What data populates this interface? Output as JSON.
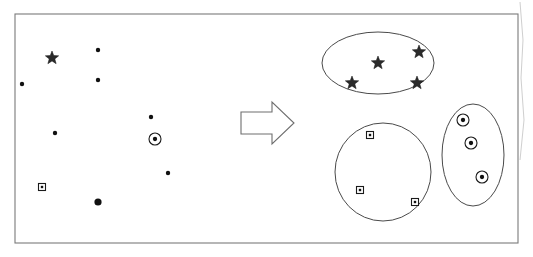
{
  "figure": {
    "background_color": "#ffffff",
    "frame_color": "#7a7a7a",
    "ink_color": "#1a1a1a"
  },
  "frame": {
    "x": 15,
    "y": 14,
    "width": 503,
    "height": 229
  },
  "arrow": {
    "name": "right-arrow",
    "points": "241,112 272,112 272,102 294,123 272,144 272,134 241,134",
    "fill": "#ffffff",
    "stroke": "#6e6e6e"
  },
  "left_panel": {
    "label": "unclustered-points",
    "points": [
      {
        "shape": "star",
        "x": 52,
        "y": 58,
        "size": 7
      },
      {
        "shape": "dot",
        "x": 98,
        "y": 50,
        "size": 2.2
      },
      {
        "shape": "dot",
        "x": 22,
        "y": 84,
        "size": 2.2
      },
      {
        "shape": "dot",
        "x": 98,
        "y": 80,
        "size": 2.2
      },
      {
        "shape": "dot",
        "x": 151,
        "y": 117,
        "size": 2.2
      },
      {
        "shape": "dot",
        "x": 55,
        "y": 133,
        "size": 2.2
      },
      {
        "shape": "circled-dot",
        "x": 155,
        "y": 139,
        "size": 6
      },
      {
        "shape": "dot",
        "x": 168,
        "y": 173,
        "size": 2.2
      },
      {
        "shape": "squared-dot",
        "x": 42,
        "y": 187,
        "size": 7
      },
      {
        "shape": "dot",
        "x": 98,
        "y": 202,
        "size": 3.6
      }
    ]
  },
  "right_panel": {
    "label": "clustered-groups",
    "clusters": [
      {
        "name": "star-cluster",
        "boundary": {
          "type": "ellipse",
          "cx": 378,
          "cy": 63,
          "rx": 56,
          "ry": 31
        },
        "members": [
          {
            "shape": "star",
            "x": 378,
            "y": 63,
            "size": 7
          },
          {
            "shape": "star",
            "x": 419,
            "y": 52,
            "size": 7
          },
          {
            "shape": "star",
            "x": 352,
            "y": 83,
            "size": 7
          },
          {
            "shape": "star",
            "x": 417,
            "y": 83,
            "size": 7
          }
        ]
      },
      {
        "name": "square-cluster",
        "boundary": {
          "type": "ellipse",
          "cx": 383,
          "cy": 172,
          "rx": 48,
          "ry": 49
        },
        "members": [
          {
            "shape": "squared-dot",
            "x": 370,
            "y": 135,
            "size": 7
          },
          {
            "shape": "squared-dot",
            "x": 360,
            "y": 190,
            "size": 7
          },
          {
            "shape": "squared-dot",
            "x": 415,
            "y": 202,
            "size": 7
          }
        ]
      },
      {
        "name": "circle-cluster",
        "boundary": {
          "type": "ellipse",
          "cx": 473,
          "cy": 155,
          "rx": 31,
          "ry": 51
        },
        "members": [
          {
            "shape": "circled-dot",
            "x": 463,
            "y": 120,
            "size": 6
          },
          {
            "shape": "circled-dot",
            "x": 471,
            "y": 143,
            "size": 6
          },
          {
            "shape": "circled-dot",
            "x": 482,
            "y": 177,
            "size": 6
          }
        ]
      }
    ]
  },
  "artifacts": [
    {
      "name": "scan-edge-artifact",
      "d": "M520,2 L523,40 L521,78 L524,120 L520,160"
    }
  ]
}
